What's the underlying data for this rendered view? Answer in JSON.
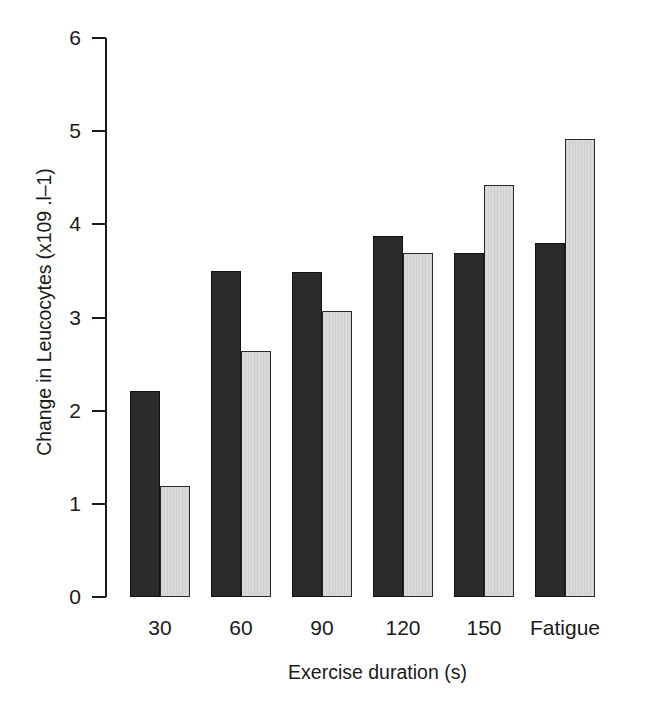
{
  "chart_data": {
    "type": "bar",
    "title": "",
    "xlabel": "Exercise duration (s)",
    "ylabel": "Change in Leucocytes (x109 .l–1)",
    "categories": [
      "30",
      "60",
      "90",
      "120",
      "150",
      "Fatigue"
    ],
    "series": [
      {
        "name": "dark",
        "color": "#2b2b2b",
        "values": [
          2.21,
          3.5,
          3.49,
          3.88,
          3.69,
          3.8
        ]
      },
      {
        "name": "light",
        "color": "#dadada",
        "values": [
          1.19,
          2.64,
          3.07,
          3.69,
          4.42,
          4.92
        ]
      }
    ],
    "ylim": [
      0,
      6
    ],
    "yticks": [
      "0",
      "1",
      "2",
      "3",
      "4",
      "5",
      "6"
    ],
    "grid": false,
    "legend": "none"
  }
}
